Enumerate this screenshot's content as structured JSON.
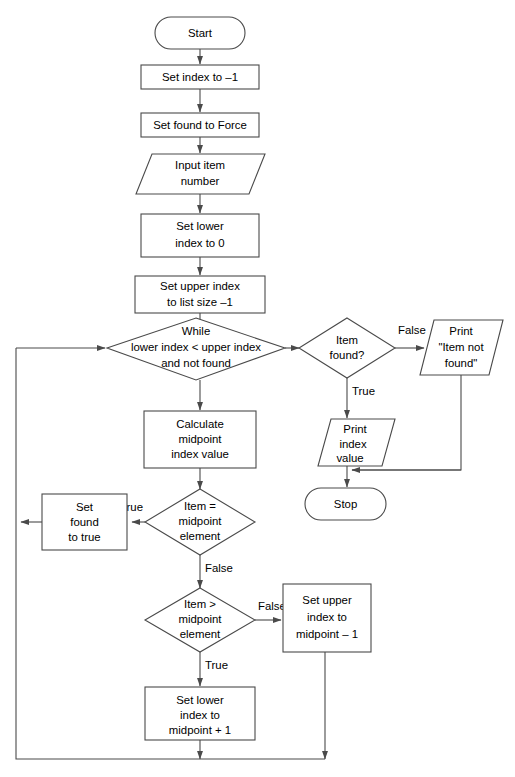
{
  "diagram": {
    "line_color": "#4a4a4a",
    "fill_color": "#ffffff",
    "text_color": "#000000"
  },
  "nodes": {
    "start": {
      "type": "terminator",
      "label": "Start"
    },
    "set_index": {
      "type": "process",
      "label": "Set index to –1"
    },
    "set_found_force": {
      "type": "process",
      "label": "Set found to Force"
    },
    "input_item": {
      "type": "io",
      "line1": "Input item",
      "line2": "number"
    },
    "set_lower": {
      "type": "process",
      "line1": "Set lower",
      "line2": "index to 0"
    },
    "set_upper_size": {
      "type": "process",
      "line1": "Set upper index",
      "line2": "to list size –1"
    },
    "while_cond": {
      "type": "decision",
      "line1": "While",
      "line2": "lower index < upper index",
      "line3": "and not found"
    },
    "item_found": {
      "type": "decision",
      "line1": "Item",
      "line2": "found?"
    },
    "print_not_found": {
      "type": "io",
      "line1": "Print",
      "line2": "\"Item not",
      "line3": "found\""
    },
    "print_index": {
      "type": "io",
      "line1": "Print",
      "line2": "index",
      "line3": "value"
    },
    "stop": {
      "type": "terminator",
      "label": "Stop"
    },
    "calculate_mid": {
      "type": "process",
      "line1": "Calculate",
      "line2": "midpoint",
      "line3": "index value"
    },
    "item_eq_mid": {
      "type": "decision",
      "line1": "Item =",
      "line2": "midpoint",
      "line3": "element"
    },
    "set_found_true": {
      "type": "process",
      "line1": "Set",
      "line2": "found",
      "line3": "to true"
    },
    "item_gt_mid": {
      "type": "decision",
      "line1": "Item >",
      "line2": "midpoint",
      "line3": "element"
    },
    "set_upper_mid": {
      "type": "process",
      "line1": "Set upper",
      "line2": "index to",
      "line3": "midpoint – 1"
    },
    "set_lower_mid": {
      "type": "process",
      "line1": "Set lower",
      "line2": "index to",
      "line3": "midpoint + 1"
    }
  },
  "edge_labels": {
    "item_found_false": "False",
    "item_found_true": "True",
    "item_eq_mid_true": "True",
    "item_eq_mid_false": "False",
    "item_gt_mid_false": "False",
    "item_gt_mid_true": "True"
  }
}
